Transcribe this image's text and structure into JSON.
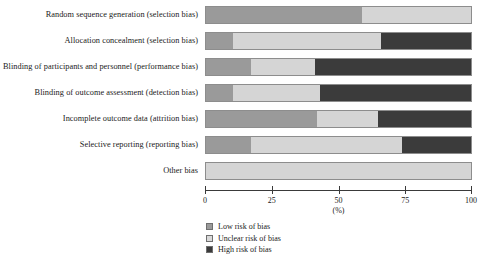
{
  "chart_data": {
    "type": "bar",
    "subtype": "stacked-horizontal-100pct",
    "title": "",
    "xlabel": "(%)",
    "ylabel": "",
    "xlim": [
      0,
      100
    ],
    "xticks": [
      0,
      25,
      50,
      75,
      100
    ],
    "xtick_labels": [
      "0",
      "25",
      "50",
      "75",
      "100"
    ],
    "grid": false,
    "legend_position": "bottom-center",
    "categories": [
      "Random sequence generation (selection bias)",
      "Allocation concealment (selection bias)",
      "Blinding of participants and personnel (performance bias)",
      "Blinding of outcome assessment (detection bias)",
      "Incomplete outcome data (attrition bias)",
      "Selective reporting (reporting bias)",
      "Other bias"
    ],
    "series": [
      {
        "name": "Low risk of bias",
        "color": "#9a9a9a",
        "values": [
          59,
          10,
          17,
          10,
          42,
          17,
          0
        ]
      },
      {
        "name": "Unclear risk of bias",
        "color": "#d5d5d5",
        "values": [
          41,
          56,
          24,
          33,
          23,
          57,
          100
        ]
      },
      {
        "name": "High risk of bias",
        "color": "#3b3b3b",
        "values": [
          0,
          34,
          59,
          57,
          35,
          26,
          0
        ]
      }
    ]
  },
  "legend": {
    "items": [
      {
        "label": "Low risk of bias",
        "swatch": "low"
      },
      {
        "label": "Unclear risk of bias",
        "swatch": "unclear"
      },
      {
        "label": "High risk of bias",
        "swatch": "high"
      }
    ]
  },
  "caption_fragment": ""
}
